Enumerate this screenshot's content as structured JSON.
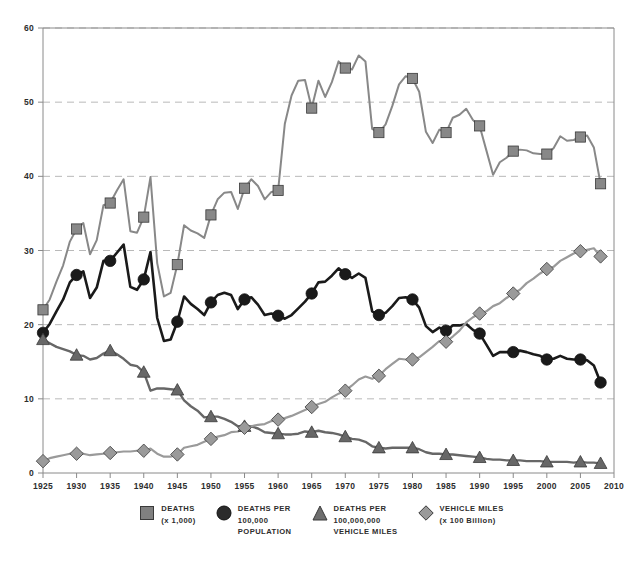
{
  "chart_data": {
    "type": "line",
    "title": "",
    "subtitle": "",
    "xlabel": "",
    "ylabel": "",
    "xlim": [
      1925,
      2010
    ],
    "ylim": [
      0,
      60
    ],
    "grid": true,
    "grid_axis": "y",
    "legend_position": "bottom",
    "x_ticks": [
      "1925",
      "1930",
      "1935",
      "1940",
      "1945",
      "1950",
      "1955",
      "1960",
      "1965",
      "1970",
      "1975",
      "1980",
      "1985",
      "1990",
      "1995",
      "2000",
      "2005",
      "2010"
    ],
    "x_tick_values": [
      1925,
      1930,
      1935,
      1940,
      1945,
      1950,
      1955,
      1960,
      1965,
      1970,
      1975,
      1980,
      1985,
      1990,
      1995,
      2000,
      2005,
      2010
    ],
    "y_ticks": [
      "0",
      "10",
      "20",
      "30",
      "40",
      "50",
      "60"
    ],
    "y_tick_values": [
      0,
      10,
      20,
      30,
      40,
      50,
      60
    ],
    "marker_years": [
      1925,
      1930,
      1935,
      1940,
      1945,
      1950,
      1955,
      1960,
      1965,
      1970,
      1975,
      1980,
      1985,
      1990,
      1995,
      2000,
      2005,
      2008
    ],
    "x": [
      1925,
      1926,
      1927,
      1928,
      1929,
      1930,
      1931,
      1932,
      1933,
      1934,
      1935,
      1936,
      1937,
      1938,
      1939,
      1940,
      1941,
      1942,
      1943,
      1944,
      1945,
      1946,
      1947,
      1948,
      1949,
      1950,
      1951,
      1952,
      1953,
      1954,
      1955,
      1956,
      1957,
      1958,
      1959,
      1960,
      1961,
      1962,
      1963,
      1964,
      1965,
      1966,
      1967,
      1968,
      1969,
      1970,
      1971,
      1972,
      1973,
      1974,
      1975,
      1976,
      1977,
      1978,
      1979,
      1980,
      1981,
      1982,
      1983,
      1984,
      1985,
      1986,
      1987,
      1988,
      1989,
      1990,
      1991,
      1992,
      1993,
      1994,
      1995,
      1996,
      1997,
      1998,
      1999,
      2000,
      2001,
      2002,
      2003,
      2004,
      2005,
      2006,
      2007,
      2008
    ],
    "series": [
      {
        "name": "DEATHS (x 1,000)",
        "marker": "square",
        "color": "#888888",
        "line_width": 2,
        "values": [
          22.0,
          23.4,
          25.8,
          28.0,
          31.2,
          32.9,
          33.7,
          29.5,
          31.4,
          36.1,
          36.4,
          38.1,
          39.6,
          32.6,
          32.4,
          34.5,
          39.9,
          28.3,
          23.8,
          24.3,
          28.1,
          33.4,
          32.7,
          32.3,
          31.7,
          34.8,
          36.9,
          37.8,
          37.9,
          35.6,
          38.4,
          39.6,
          38.7,
          36.9,
          37.9,
          38.1,
          47.1,
          50.9,
          52.9,
          53.0,
          49.2,
          52.9,
          50.7,
          52.7,
          55.5,
          54.6,
          54.4,
          56.3,
          55.5,
          46.4,
          45.9,
          47.0,
          49.5,
          52.4,
          53.5,
          53.2,
          51.4,
          46.0,
          44.5,
          46.3,
          45.9,
          47.9,
          48.3,
          49.1,
          47.6,
          46.8,
          43.5,
          40.2,
          41.9,
          42.5,
          43.4,
          43.6,
          43.5,
          43.1,
          43.0,
          43.0,
          43.8,
          45.4,
          44.8,
          44.9,
          45.3,
          45.5,
          43.9,
          39.0
        ]
      },
      {
        "name": "DEATHS PER 100,000 POPULATION",
        "marker": "circle",
        "color": "#1a1a1a",
        "line_width": 2.6,
        "values": [
          18.9,
          20.1,
          21.8,
          23.4,
          25.7,
          26.7,
          27.2,
          23.6,
          25.0,
          28.6,
          28.6,
          29.7,
          30.8,
          25.1,
          24.7,
          26.1,
          29.8,
          20.9,
          17.8,
          18.0,
          20.4,
          23.8,
          22.8,
          22.1,
          21.3,
          23.0,
          24.0,
          24.3,
          24.0,
          22.1,
          23.4,
          23.7,
          22.7,
          21.3,
          21.5,
          21.2,
          20.8,
          21.3,
          22.2,
          23.1,
          24.2,
          25.7,
          25.8,
          26.6,
          27.6,
          26.8,
          26.3,
          26.9,
          26.3,
          21.8,
          21.3,
          21.6,
          22.5,
          23.6,
          23.7,
          23.4,
          22.3,
          19.8,
          19.0,
          19.6,
          19.2,
          19.9,
          19.9,
          20.1,
          19.3,
          18.8,
          17.3,
          15.8,
          16.3,
          16.3,
          16.3,
          16.5,
          16.3,
          16.0,
          15.8,
          15.3,
          15.4,
          15.8,
          15.4,
          15.3,
          15.3,
          15.2,
          14.5,
          12.2
        ]
      },
      {
        "name": "DEATHS PER 100,000,000 VEHICLE MILES",
        "marker": "triangle",
        "color": "#676767",
        "line_width": 2.4,
        "values": [
          18.0,
          17.5,
          17.0,
          16.7,
          16.4,
          15.9,
          15.8,
          15.3,
          15.5,
          16.1,
          16.5,
          16.0,
          15.4,
          14.6,
          14.4,
          13.6,
          11.1,
          11.4,
          11.4,
          11.3,
          11.2,
          9.8,
          9.0,
          8.4,
          7.5,
          7.6,
          7.6,
          7.3,
          6.9,
          6.3,
          6.3,
          6.3,
          6.0,
          5.5,
          5.4,
          5.3,
          5.2,
          5.2,
          5.3,
          5.6,
          5.5,
          5.7,
          5.5,
          5.4,
          5.2,
          4.9,
          4.6,
          4.5,
          4.2,
          3.6,
          3.4,
          3.3,
          3.4,
          3.4,
          3.4,
          3.4,
          3.2,
          2.8,
          2.6,
          2.6,
          2.5,
          2.5,
          2.4,
          2.3,
          2.2,
          2.1,
          1.9,
          1.8,
          1.8,
          1.7,
          1.7,
          1.7,
          1.6,
          1.6,
          1.6,
          1.5,
          1.5,
          1.5,
          1.5,
          1.4,
          1.5,
          1.4,
          1.4,
          1.3
        ]
      },
      {
        "name": "VEHICLE MILES (x 100 Billion)",
        "marker": "diamond",
        "color": "#9a9a9a",
        "line_width": 2.2,
        "values": [
          1.6,
          2.0,
          2.2,
          2.4,
          2.6,
          2.6,
          2.6,
          2.4,
          2.5,
          2.6,
          2.7,
          2.8,
          2.9,
          2.9,
          3.0,
          3.0,
          3.3,
          2.6,
          2.2,
          2.2,
          2.5,
          3.4,
          3.6,
          3.8,
          4.2,
          4.6,
          4.9,
          5.1,
          5.5,
          5.6,
          6.1,
          6.3,
          6.5,
          6.6,
          7.0,
          7.2,
          7.4,
          7.7,
          8.1,
          8.5,
          8.9,
          9.3,
          9.6,
          10.2,
          10.7,
          11.1,
          11.8,
          12.6,
          13.0,
          12.7,
          13.1,
          14.0,
          14.7,
          15.4,
          15.3,
          15.3,
          15.6,
          16.3,
          17.0,
          17.8,
          17.7,
          18.4,
          19.2,
          20.3,
          21.0,
          21.5,
          21.8,
          22.5,
          22.9,
          23.6,
          24.2,
          24.7,
          25.6,
          26.2,
          26.9,
          27.5,
          27.8,
          28.6,
          29.1,
          29.6,
          29.9,
          30.1,
          30.3,
          29.2
        ]
      }
    ]
  },
  "legend": {
    "items": [
      {
        "marker": "square",
        "color": "#808080",
        "line1": "DEATHS",
        "line2": "(x 1,000)",
        "line3": ""
      },
      {
        "marker": "circle",
        "color": "#2b2b2b",
        "line1": "DEATHS PER",
        "line2": "100,000",
        "line3": "POPULATION"
      },
      {
        "marker": "triangle",
        "color": "#6e6e6e",
        "line1": "DEATHS PER",
        "line2": "100,000,000",
        "line3": "VEHICLE MILES"
      },
      {
        "marker": "diamond",
        "color": "#9a9a9a",
        "line1": "VEHICLE MILES",
        "line2": "(x 100 Billion)",
        "line3": ""
      }
    ]
  }
}
